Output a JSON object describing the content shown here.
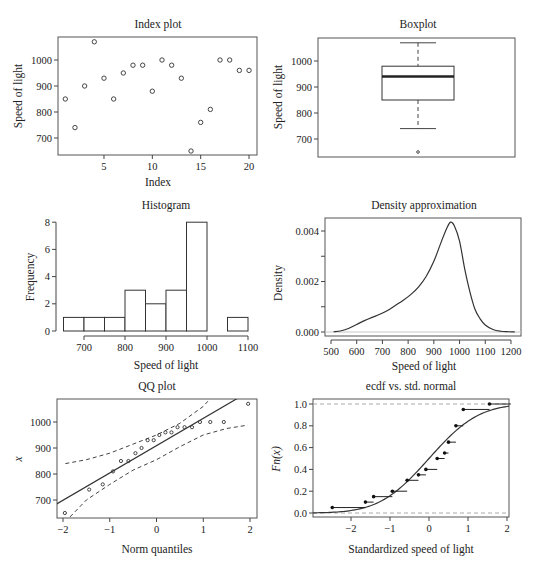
{
  "chart_data": [
    {
      "id": "index",
      "type": "scatter",
      "title": "Index plot",
      "xlabel": "Index",
      "ylabel": "Speed of light",
      "x": [
        1,
        2,
        3,
        4,
        5,
        6,
        7,
        8,
        9,
        10,
        11,
        12,
        13,
        14,
        15,
        16,
        17,
        18,
        19,
        20
      ],
      "y": [
        850,
        740,
        900,
        1070,
        930,
        850,
        950,
        980,
        980,
        880,
        1000,
        980,
        930,
        650,
        760,
        810,
        1000,
        1000,
        960,
        960
      ],
      "xticks": [
        5,
        10,
        15,
        20
      ],
      "yticks": [
        700,
        800,
        900,
        1000
      ]
    },
    {
      "id": "boxplot",
      "type": "box",
      "title": "Boxplot",
      "ylabel": "Speed of light",
      "min_whisker": 740,
      "q1": 850,
      "median": 940,
      "q3": 980,
      "max_whisker": 1070,
      "outliers": [
        650
      ],
      "yticks": [
        700,
        800,
        900,
        1000
      ]
    },
    {
      "id": "histogram",
      "type": "bar",
      "title": "Histogram",
      "xlabel": "Speed of light",
      "ylabel": "Frequency",
      "bins": [
        650,
        700,
        750,
        800,
        850,
        900,
        950,
        1000,
        1050,
        1100
      ],
      "values": [
        1,
        1,
        1,
        3,
        2,
        3,
        8,
        0,
        1
      ],
      "xticks": [
        700,
        800,
        900,
        1000,
        1100
      ],
      "yticks": [
        0,
        2,
        4,
        6,
        8
      ]
    },
    {
      "id": "density",
      "type": "line",
      "title": "Density approximation",
      "xlabel": "Speed of light",
      "ylabel": "Density",
      "x": [
        510,
        540,
        570,
        600,
        630,
        660,
        690,
        720,
        750,
        780,
        810,
        840,
        870,
        900,
        930,
        950,
        965,
        980,
        1000,
        1020,
        1040,
        1060,
        1080,
        1100,
        1130,
        1160,
        1190,
        1215
      ],
      "y": [
        1e-05,
        5e-05,
        0.00015,
        0.0003,
        0.00045,
        0.00058,
        0.0007,
        0.00085,
        0.00105,
        0.00125,
        0.00148,
        0.00178,
        0.0022,
        0.0028,
        0.0036,
        0.0041,
        0.00435,
        0.0042,
        0.0036,
        0.0025,
        0.0016,
        0.0009,
        0.00052,
        0.00028,
        0.0001,
        3e-05,
        1e-05,
        0.0
      ],
      "xticks": [
        500,
        600,
        700,
        800,
        900,
        1000,
        1100,
        1200
      ],
      "yticks": [
        "0.000",
        "0.002",
        "0.004"
      ]
    },
    {
      "id": "qq",
      "type": "scatter",
      "title": "QQ plot",
      "xlabel": "Norm quantiles",
      "ylabel": "x",
      "theoretical": [
        -1.96,
        -1.44,
        -1.15,
        -0.93,
        -0.76,
        -0.6,
        -0.45,
        -0.32,
        -0.19,
        -0.06,
        0.06,
        0.19,
        0.32,
        0.45,
        0.6,
        0.76,
        0.93,
        1.15,
        1.44,
        1.96
      ],
      "sample": [
        650,
        740,
        760,
        810,
        850,
        850,
        880,
        900,
        930,
        930,
        950,
        960,
        960,
        980,
        980,
        980,
        1000,
        1000,
        1000,
        1070
      ],
      "reference_line": {
        "slope": 105,
        "intercept": 909
      },
      "envelope_upper": [
        [
          -1.95,
          840
        ],
        [
          -1.5,
          855
        ],
        [
          -1,
          880
        ],
        [
          -0.5,
          915
        ],
        [
          0,
          950
        ],
        [
          0.5,
          995
        ],
        [
          1,
          1060
        ],
        [
          1.1,
          1080
        ]
      ],
      "envelope_lower": [
        [
          -1.85,
          635
        ],
        [
          -1.5,
          700
        ],
        [
          -1,
          760
        ],
        [
          -0.5,
          815
        ],
        [
          0,
          855
        ],
        [
          0.5,
          905
        ],
        [
          1,
          950
        ],
        [
          1.5,
          975
        ],
        [
          1.95,
          988
        ]
      ],
      "xticks": [
        -2,
        -1,
        0,
        1,
        2
      ],
      "yticks": [
        700,
        800,
        900,
        1000
      ]
    },
    {
      "id": "ecdf",
      "type": "step",
      "title": "ecdf vs. std. normal",
      "xlabel": "Standardized speed of light",
      "ylabel": "Fn(x)",
      "steps": [
        [
          -2.48,
          0.05
        ],
        [
          -1.63,
          0.1
        ],
        [
          -1.42,
          0.15
        ],
        [
          -0.94,
          0.2
        ],
        [
          -0.56,
          0.3
        ],
        [
          -0.27,
          0.35
        ],
        [
          -0.08,
          0.4
        ],
        [
          0.21,
          0.5
        ],
        [
          0.4,
          0.55
        ],
        [
          0.5,
          0.65
        ],
        [
          0.69,
          0.8
        ],
        [
          0.88,
          0.95
        ],
        [
          1.55,
          1.0
        ]
      ],
      "xticks": [
        -2,
        -1,
        0,
        1,
        2
      ],
      "yticks": [
        "0.0",
        "0.2",
        "0.4",
        "0.6",
        "0.8",
        "1.0"
      ]
    }
  ],
  "labels": {
    "index_title": "Index plot",
    "index_xlabel": "Index",
    "index_ylabel": "Speed of light",
    "box_title": "Boxplot",
    "box_ylabel": "Speed of light",
    "hist_title": "Histogram",
    "hist_xlabel": "Speed of light",
    "hist_ylabel": "Frequency",
    "dens_title": "Density approximation",
    "dens_xlabel": "Speed of light",
    "dens_ylabel": "Density",
    "qq_title": "QQ plot",
    "qq_xlabel": "Norm quantiles",
    "qq_ylabel": "x",
    "ecdf_title": "ecdf vs. std. normal",
    "ecdf_xlabel": "Standardized speed of light",
    "ecdf_ylabel": "Fn(x)"
  }
}
